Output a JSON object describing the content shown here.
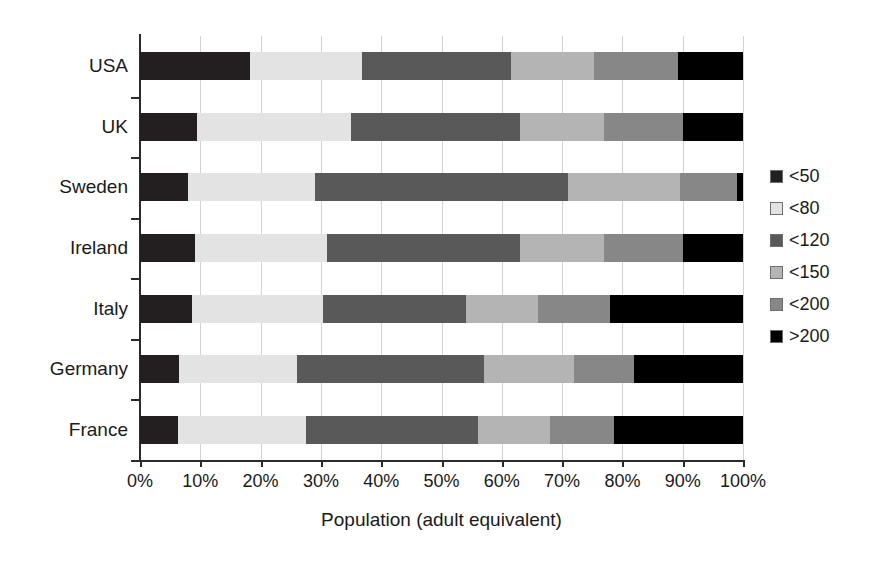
{
  "chart_data": {
    "type": "bar",
    "orientation": "horizontal",
    "stacked": true,
    "normalized_percent": true,
    "title": "",
    "xlabel": "Population (adult equivalent)",
    "ylabel": "",
    "xlim": [
      0,
      100
    ],
    "grid": true,
    "legend_position": "right",
    "xtick_labels": [
      "0%",
      "10%",
      "20%",
      "30%",
      "40%",
      "50%",
      "60%",
      "70%",
      "80%",
      "90%",
      "100%"
    ],
    "xtick_values": [
      0,
      10,
      20,
      30,
      40,
      50,
      60,
      70,
      80,
      90,
      100
    ],
    "categories": [
      "USA",
      "UK",
      "Sweden",
      "Ireland",
      "Italy",
      "Germany",
      "France"
    ],
    "series": [
      {
        "name": "<50",
        "color": "#231f20",
        "values": [
          18.2,
          9.5,
          8.0,
          9.2,
          8.7,
          6.5,
          6.3
        ]
      },
      {
        "name": "<80",
        "color": "#e3e3e3",
        "values": [
          18.6,
          25.5,
          21.0,
          21.8,
          21.7,
          19.5,
          21.3
        ]
      },
      {
        "name": "<120",
        "color": "#595959",
        "values": [
          24.7,
          28.0,
          42.0,
          32.0,
          23.6,
          31.0,
          28.4
        ]
      },
      {
        "name": "<150",
        "color": "#b4b4b4",
        "values": [
          13.8,
          14.0,
          18.5,
          14.0,
          12.0,
          15.0,
          12.0
        ]
      },
      {
        "name": "<200",
        "color": "#878787",
        "values": [
          13.9,
          13.0,
          9.5,
          13.0,
          12.0,
          10.0,
          10.6
        ]
      },
      {
        "name": ">200",
        "color": "#000000",
        "values": [
          10.8,
          10.0,
          1.0,
          10.0,
          22.0,
          18.0,
          21.4
        ]
      }
    ]
  }
}
